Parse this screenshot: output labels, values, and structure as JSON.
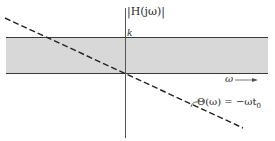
{
  "diagram": {
    "magnitude_label": "|H(jω)|",
    "magnitude_level_label": "k",
    "frequency_axis_label": "ω",
    "phase_label": "Θ(ω) = −ωt",
    "phase_label_subscript": "0",
    "colors": {
      "band_fill": "#d8d8d8",
      "line": "#3a3a3a",
      "dashed": "#222222"
    }
  }
}
